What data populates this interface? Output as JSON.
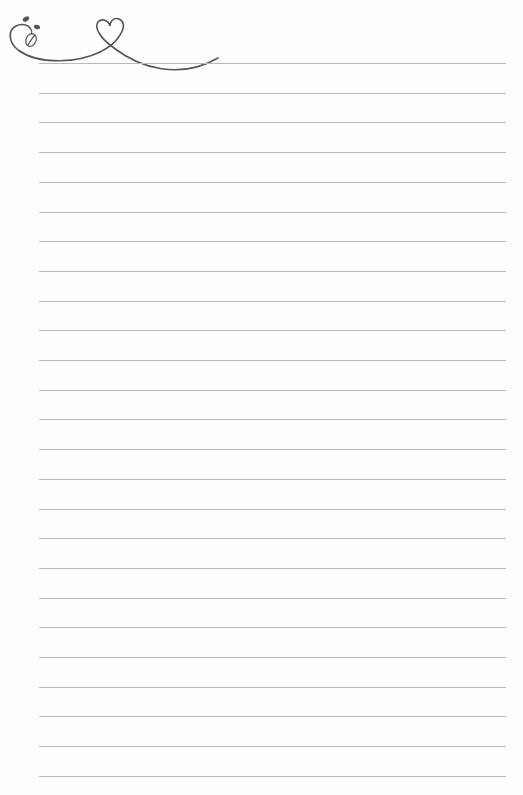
{
  "page": {
    "type": "lined-writing-paper",
    "background": "#fefefe",
    "rule_color": "#b9b9b9",
    "ornament_color": "#555555",
    "rules": {
      "count": 25,
      "first_y": 63,
      "spacing": 29.7,
      "left": 39,
      "width": 467
    },
    "ornament": {
      "icon": "heart-vine-with-leaves-icon"
    }
  }
}
